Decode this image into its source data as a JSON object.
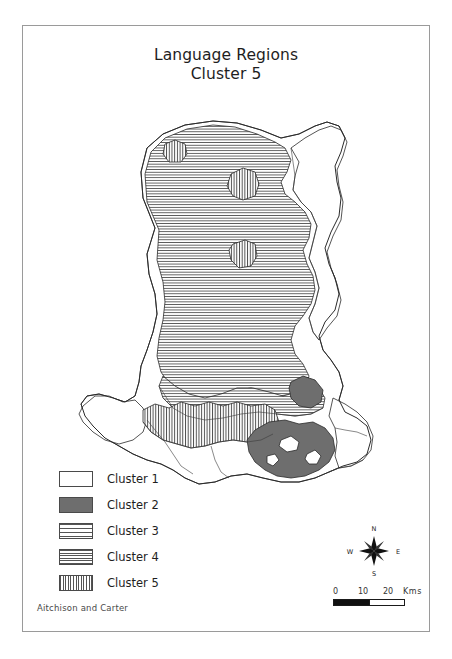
{
  "figure": {
    "title_line1": "Language Regions",
    "title_line2": "Cluster 5",
    "credit": "Aitchison and Carter",
    "border_color": "#9a9a9a",
    "background_color": "#ffffff"
  },
  "legend": {
    "items": [
      {
        "label": "Cluster 1",
        "pattern": "blank-white",
        "color": "#ffffff"
      },
      {
        "label": "Cluster 2",
        "pattern": "solid-dark-gray",
        "color": "#6e6e6e"
      },
      {
        "label": "Cluster 3",
        "pattern": "horizontal-lines-wide",
        "color": "#555555"
      },
      {
        "label": "Cluster 4",
        "pattern": "horizontal-lines-dense",
        "color": "#555555"
      },
      {
        "label": "Cluster 5",
        "pattern": "vertical-lines",
        "color": "#555555"
      }
    ]
  },
  "compass": {
    "icon": "compass-rose-icon",
    "north_label": "N",
    "south_label": "S",
    "east_label": "E",
    "west_label": "W"
  },
  "scale_bar": {
    "ticks": [
      "0",
      "10",
      "20"
    ],
    "unit": "Kms"
  },
  "map": {
    "region_name": "Wales",
    "outline_color": "#2a2a2a",
    "areas": [
      {
        "name": "north-wales-interior",
        "cluster": "Cluster 4"
      },
      {
        "name": "mid-wales",
        "cluster": "Cluster 4"
      },
      {
        "name": "north-east-border",
        "cluster": "Cluster 1"
      },
      {
        "name": "south-pembrokeshire",
        "cluster": "Cluster 1"
      },
      {
        "name": "south-east-lowland",
        "cluster": "Cluster 1"
      },
      {
        "name": "south-wales-valleys",
        "cluster": "Cluster 2"
      },
      {
        "name": "swansea-bay",
        "cluster": "Cluster 2"
      },
      {
        "name": "carmarthenshire-belt",
        "cluster": "Cluster 5"
      },
      {
        "name": "north-wales-enclave-a",
        "cluster": "Cluster 5"
      },
      {
        "name": "north-wales-enclave-b",
        "cluster": "Cluster 5"
      },
      {
        "name": "north-coast-enclave",
        "cluster": "Cluster 5"
      }
    ]
  }
}
